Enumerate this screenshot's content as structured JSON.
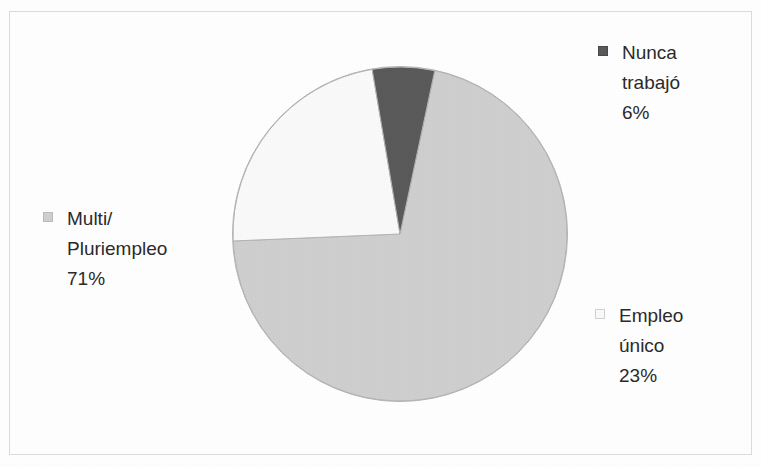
{
  "chart_data": {
    "type": "pie",
    "title": "",
    "subtitle": "",
    "xlabel": "",
    "ylabel": "",
    "legend_position": "outside-labels",
    "grid": false,
    "categories": [
      "Multi/ Pluriempleo",
      "Empleo único",
      "Nunca trabajó"
    ],
    "values": [
      71,
      23,
      6
    ],
    "value_unit": "%",
    "slices": [
      {
        "label_line_1": "Multi/",
        "label_line_2": "Pluriempleo",
        "value_label": "71%",
        "value": 71,
        "color": "#cfcfcf",
        "swatch": "legend-swatch-light-gray"
      },
      {
        "label_line_1": "Empleo",
        "label_line_2": "único",
        "value_label": "23%",
        "value": 23,
        "color": "#fafafa",
        "swatch": "legend-swatch-white"
      },
      {
        "label_line_1": "Nunca",
        "label_line_2": "trabajó",
        "value_label": "6%",
        "value": 6,
        "color": "#5a5a5a",
        "swatch": "legend-swatch-dark-gray"
      }
    ],
    "geometry": {
      "start_angle_deg": -78,
      "direction": "clockwise",
      "center_x": 400,
      "center_y": 234,
      "radius": 168
    }
  },
  "figure": {
    "border_color": "#dcdcdc",
    "background_color": "#ffffff",
    "outline_color": "#b4b4b4"
  }
}
